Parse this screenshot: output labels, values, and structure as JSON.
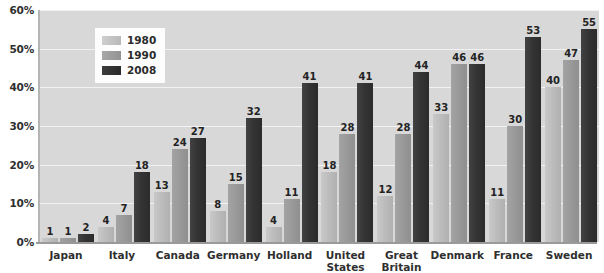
{
  "chart_data": {
    "type": "bar",
    "title": "",
    "subtitle": "",
    "xlabel": "",
    "ylabel": "",
    "ylim": [
      0,
      60
    ],
    "ytick_labels": [
      "0%",
      "10%",
      "20%",
      "30%",
      "40%",
      "50%",
      "60%"
    ],
    "ytick_values": [
      0,
      10,
      20,
      30,
      40,
      50,
      60
    ],
    "grid": true,
    "legend_position": "top-left-inside",
    "categories": [
      "Japan",
      "Italy",
      "Canada",
      "Germany",
      "Holland",
      "United\nStates",
      "Great\nBritain",
      "Denmark",
      "France",
      "Sweden"
    ],
    "series": [
      {
        "name": "1980",
        "color": "#bdbdbd",
        "values": [
          1,
          4,
          13,
          8,
          4,
          18,
          12,
          33,
          11,
          40
        ],
        "labels": [
          "1",
          "4",
          "13",
          "8",
          "4",
          "18",
          "12",
          "33",
          "11",
          "40"
        ]
      },
      {
        "name": "1990",
        "color": "#999999",
        "values": [
          1,
          7,
          24,
          15,
          11,
          28,
          28,
          46,
          30,
          47
        ],
        "labels": [
          "1",
          "7",
          "24",
          "15",
          "11",
          "28",
          "28",
          "46",
          "30",
          "47"
        ]
      },
      {
        "name": "2008",
        "color": "#343434",
        "values": [
          2,
          18,
          27,
          32,
          41,
          41,
          44,
          46,
          53,
          55
        ],
        "labels": [
          "2",
          "18",
          "27",
          "32",
          "41",
          "41",
          "44",
          "46",
          "53",
          "55"
        ]
      }
    ]
  },
  "legend": {
    "items": [
      {
        "label": "1980",
        "swatch": "s1980"
      },
      {
        "label": "1990",
        "swatch": "s1990"
      },
      {
        "label": "2008",
        "swatch": "s2008"
      }
    ]
  },
  "plot_background": "#d8d8d8",
  "gridline_color": "#f2f2f2"
}
